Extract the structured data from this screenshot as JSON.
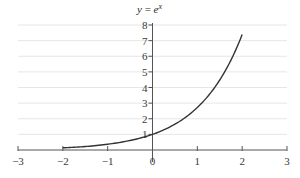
{
  "chart_data": {
    "type": "line",
    "title_parts": {
      "lhs": "y",
      "eq": " = ",
      "base": "e",
      "exp": "x"
    },
    "xlabel": "",
    "ylabel": "",
    "xlim": [
      -3,
      3
    ],
    "ylim": [
      0,
      8
    ],
    "grid": {
      "horizontal": true,
      "vertical": false
    },
    "legend": null,
    "x_ticks": [
      -3,
      -2,
      -1,
      0,
      1,
      2,
      3
    ],
    "x_tick_labels": [
      "−3",
      "−2",
      "−1",
      "0",
      "1",
      "2",
      "3"
    ],
    "y_ticks": [
      1,
      2,
      3,
      4,
      5,
      6,
      7,
      8
    ],
    "y_tick_labels": [
      "1",
      "2",
      "3",
      "4",
      "5",
      "6",
      "7",
      "8"
    ],
    "series": [
      {
        "name": "e^x",
        "color": "#333333",
        "x": [
          -2,
          -1.5,
          -1,
          -0.5,
          0,
          0.5,
          1,
          1.5,
          2
        ],
        "y": [
          0.14,
          0.22,
          0.37,
          0.61,
          1.0,
          1.65,
          2.72,
          4.48,
          7.39
        ]
      }
    ]
  },
  "colors": {
    "axis": "#555555",
    "grid": "#e6e6e6",
    "curve": "#333333"
  }
}
